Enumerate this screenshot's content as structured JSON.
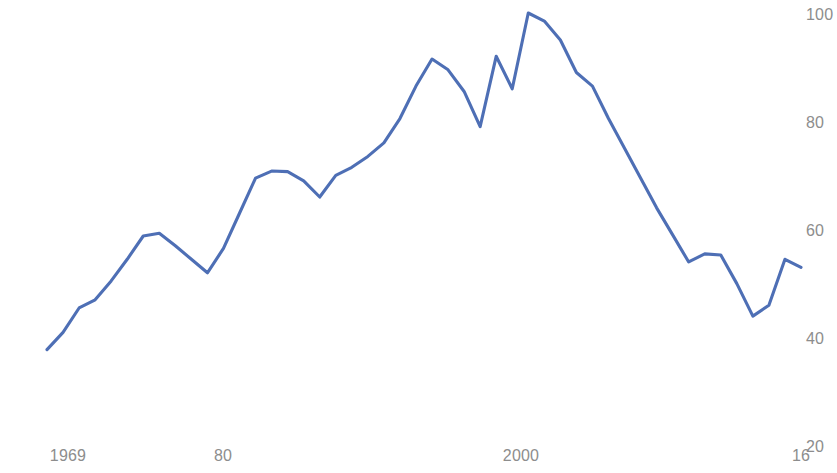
{
  "chart_data": {
    "type": "line",
    "title": "",
    "subtitle": "",
    "xlabel": "",
    "ylabel": "",
    "grid": false,
    "legend": null,
    "line_color": "#4e6fb5",
    "axis_text_color": "#8d8d8d",
    "background_color": "#ffffff",
    "xlim": [
      1969,
      2016
    ],
    "ylim": [
      20,
      100
    ],
    "x_ticks": [
      1969,
      1980,
      2000,
      2016
    ],
    "x_tick_labels": [
      "1969",
      "80",
      "2000",
      "16"
    ],
    "y_ticks": [
      20,
      40,
      60,
      80,
      100
    ],
    "y_tick_labels": [
      "20",
      "40",
      "60",
      "80",
      "100"
    ],
    "x": [
      1969,
      1970,
      1971,
      1972,
      1973,
      1974,
      1975,
      1976,
      1977,
      1978,
      1979,
      1980,
      1981,
      1982,
      1983,
      1984,
      1985,
      1986,
      1987,
      1988,
      1989,
      1990,
      1991,
      1992,
      1993,
      1994,
      1995,
      1996,
      1997,
      1998,
      1999,
      2000,
      2001,
      2002,
      2003,
      2004,
      2005,
      2006,
      2007,
      2008,
      2009,
      2010,
      2011,
      2012,
      2013,
      2014,
      2015,
      2016
    ],
    "values": [
      37.8,
      41.0,
      45.5,
      47.0,
      50.5,
      54.5,
      58.8,
      59.3,
      57.0,
      54.5,
      52.0,
      56.5,
      63.0,
      69.5,
      70.8,
      70.7,
      69.0,
      66.0,
      70.0,
      71.5,
      73.5,
      76.0,
      80.5,
      86.5,
      91.5,
      89.5,
      85.5,
      79.0,
      92.0,
      86.0,
      100.0,
      98.5,
      95.0,
      89.0,
      86.5,
      80.5,
      75.0,
      69.5,
      64.0,
      59.0,
      54.0,
      55.5,
      55.3,
      50.0,
      44.0,
      46.0,
      54.5,
      53.0
    ],
    "series": [
      {
        "name": "series-1",
        "values": [
          37.8,
          41.0,
          45.5,
          47.0,
          50.5,
          54.5,
          58.8,
          59.3,
          57.0,
          54.5,
          52.0,
          56.5,
          63.0,
          69.5,
          70.8,
          70.7,
          69.0,
          66.0,
          70.0,
          71.5,
          73.5,
          76.0,
          80.5,
          86.5,
          91.5,
          89.5,
          85.5,
          79.0,
          92.0,
          86.0,
          100.0,
          98.5,
          95.0,
          89.0,
          86.5,
          80.5,
          75.0,
          69.5,
          64.0,
          59.0,
          54.0,
          55.5,
          55.3,
          50.0,
          44.0,
          46.0,
          54.5,
          53.0
        ]
      }
    ],
    "annotations": []
  }
}
